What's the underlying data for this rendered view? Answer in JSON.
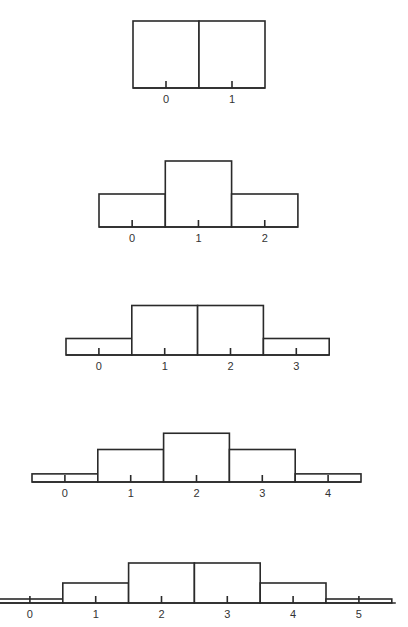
{
  "colors": {
    "stroke": "#2a2a2a",
    "fill": "#ffffff",
    "label": "#333333"
  },
  "chart_data": [
    {
      "type": "bar",
      "title": "",
      "xlabel": "",
      "ylabel": "",
      "categories": [
        "0",
        "1"
      ],
      "values": [
        0.5,
        0.5
      ],
      "layout": {
        "left": 133,
        "baseline": 88,
        "bin_width": 66,
        "scale": 134
      }
    },
    {
      "type": "bar",
      "title": "",
      "xlabel": "",
      "ylabel": "",
      "categories": [
        "0",
        "1",
        "2"
      ],
      "values": [
        0.25,
        0.5,
        0.25
      ],
      "layout": {
        "left": 99,
        "baseline": 227,
        "bin_width": 66.3,
        "scale": 132
      }
    },
    {
      "type": "bar",
      "title": "",
      "xlabel": "",
      "ylabel": "",
      "categories": [
        "0",
        "1",
        "2",
        "3"
      ],
      "values": [
        0.125,
        0.375,
        0.375,
        0.125
      ],
      "layout": {
        "left": 66,
        "baseline": 355,
        "bin_width": 65.8,
        "scale": 132
      }
    },
    {
      "type": "bar",
      "title": "",
      "xlabel": "",
      "ylabel": "",
      "categories": [
        "0",
        "1",
        "2",
        "3",
        "4"
      ],
      "values": [
        0.0625,
        0.25,
        0.375,
        0.25,
        0.0625
      ],
      "layout": {
        "left": 32,
        "baseline": 482,
        "bin_width": 65.8,
        "scale": 130
      }
    },
    {
      "type": "bar",
      "title": "",
      "xlabel": "",
      "ylabel": "",
      "categories": [
        "0",
        "1",
        "2",
        "3",
        "4",
        "5"
      ],
      "values": [
        0.03125,
        0.15625,
        0.3125,
        0.3125,
        0.15625,
        0.03125
      ],
      "layout": {
        "left": -3,
        "baseline": 603,
        "bin_width": 65.8,
        "scale": 128
      }
    }
  ]
}
